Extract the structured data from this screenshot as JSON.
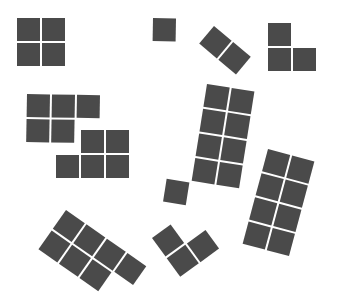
{
  "diagram": {
    "background": "#ffffff",
    "cell_color": "#4a4a4a",
    "cell_size": 23,
    "cell_gap": 2,
    "pieces": [
      {
        "name": "square-tetromino",
        "origin": [
          17,
          18
        ],
        "rotation": 0,
        "cells": [
          [
            0,
            0
          ],
          [
            1,
            0
          ],
          [
            0,
            1
          ],
          [
            1,
            1
          ]
        ]
      },
      {
        "name": "monomino",
        "origin": [
          153,
          18
        ],
        "rotation": 1,
        "cells": [
          [
            0,
            0
          ]
        ]
      },
      {
        "name": "domino-diagonal",
        "origin": [
          214,
          26
        ],
        "rotation": 40,
        "cells": [
          [
            0,
            0
          ],
          [
            1,
            0
          ]
        ]
      },
      {
        "name": "l-tromino-top-right",
        "origin": [
          268,
          23
        ],
        "rotation": 0,
        "cells": [
          [
            0,
            0
          ],
          [
            0,
            1
          ],
          [
            1,
            1
          ]
        ]
      },
      {
        "name": "p-pentomino-upper",
        "origin": [
          27,
          94
        ],
        "rotation": 1,
        "cells": [
          [
            0,
            0
          ],
          [
            1,
            0
          ],
          [
            2,
            0
          ],
          [
            0,
            1
          ],
          [
            1,
            1
          ]
        ]
      },
      {
        "name": "p-pentomino-lower",
        "origin": [
          56,
          130
        ],
        "rotation": 0,
        "cells": [
          [
            1,
            0
          ],
          [
            2,
            0
          ],
          [
            0,
            1
          ],
          [
            1,
            1
          ],
          [
            2,
            1
          ]
        ]
      },
      {
        "name": "tall-nonomino",
        "origin": [
          207,
          84
        ],
        "rotation": 9,
        "cells": [
          [
            0,
            0
          ],
          [
            1,
            0
          ],
          [
            0,
            1
          ],
          [
            1,
            1
          ],
          [
            0,
            2
          ],
          [
            1,
            2
          ],
          [
            0,
            3
          ],
          [
            1,
            3
          ],
          [
            -1,
            4
          ]
        ]
      },
      {
        "name": "rect-octomino",
        "origin": [
          268,
          149
        ],
        "rotation": 15,
        "cells": [
          [
            0,
            0
          ],
          [
            1,
            0
          ],
          [
            0,
            1
          ],
          [
            1,
            1
          ],
          [
            0,
            2
          ],
          [
            1,
            2
          ],
          [
            0,
            3
          ],
          [
            1,
            3
          ]
        ]
      },
      {
        "name": "heptomino-bottom-left",
        "origin": [
          66,
          210
        ],
        "rotation": 35,
        "cells": [
          [
            0,
            0
          ],
          [
            1,
            0
          ],
          [
            2,
            0
          ],
          [
            3,
            0
          ],
          [
            0,
            1
          ],
          [
            1,
            1
          ],
          [
            2,
            1
          ]
        ]
      },
      {
        "name": "l-tromino-bottom",
        "origin": [
          152,
          238
        ],
        "rotation": -36,
        "cells": [
          [
            0,
            0
          ],
          [
            0,
            1
          ],
          [
            1,
            1
          ]
        ]
      }
    ]
  }
}
